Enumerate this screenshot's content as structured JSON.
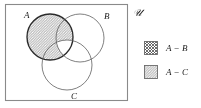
{
  "figure": {
    "type": "venn-diagram",
    "universe": {
      "symbol": "ℋ",
      "symbol_name": "script-u",
      "display": "𝒰"
    },
    "frame": {
      "x": 5,
      "y": 4,
      "width": 123,
      "height": 97,
      "stroke": "#8a8a8a",
      "fill": "#ffffff"
    },
    "sets": [
      {
        "id": "A",
        "label": "A",
        "label_x": 24,
        "label_y": 18,
        "cx": 50,
        "cy": 37,
        "r": 23
      },
      {
        "id": "B",
        "label": "B",
        "label_x": 104,
        "label_y": 19,
        "cx": 80,
        "cy": 38,
        "r": 24
      },
      {
        "id": "C",
        "label": "C",
        "label_x": 71,
        "label_y": 98,
        "cx": 67,
        "cy": 65,
        "r": 25
      }
    ],
    "shaded_regions": [
      {
        "name": "A-only-region",
        "pattern": "crosshatch",
        "description": "A minus B minus C"
      },
      {
        "name": "A-intersect-B-minus-C",
        "pattern": "diagonal",
        "description": "A and B but not C"
      },
      {
        "name": "A-intersect-C-minus-B",
        "pattern": "diagonal",
        "description": "A and C but not B"
      }
    ]
  },
  "legend": {
    "items": [
      {
        "swatch_name": "swatch-a-minus-b",
        "pattern": "crosshatch",
        "label": "A − B"
      },
      {
        "swatch_name": "swatch-a-minus-c",
        "pattern": "diagonal",
        "label": "A − C"
      }
    ]
  },
  "colors": {
    "stroke": "#2b2b2b",
    "frame_stroke": "#8a8a8a",
    "hatch": "#555555",
    "background": "#ffffff"
  }
}
